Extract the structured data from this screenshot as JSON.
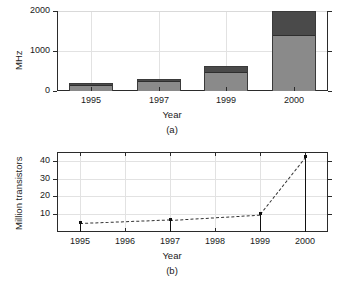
{
  "figure": {
    "panel_a_caption": "(a)",
    "panel_b_caption": "(b)"
  },
  "chart_data": [
    {
      "id": "panel-a",
      "type": "bar",
      "title": "",
      "subtitle": "(a)",
      "xlabel": "Year",
      "ylabel": "MHz",
      "categories": [
        "1995",
        "1997",
        "1999",
        "2000"
      ],
      "ylim": [
        0,
        2000
      ],
      "yticks": [
        0,
        1000,
        2000
      ],
      "yticklabels": [
        "0",
        "1000",
        "2000"
      ],
      "grid": true,
      "legend": "none",
      "stacked": true,
      "series": [
        {
          "name": "lower-segment",
          "color": "#8a8a8a",
          "values": [
            150,
            250,
            480,
            1400
          ]
        },
        {
          "name": "upper-segment",
          "color": "#4a4a4a",
          "values": [
            50,
            50,
            150,
            600
          ]
        }
      ],
      "totals": [
        200,
        300,
        630,
        2000
      ]
    },
    {
      "id": "panel-b",
      "type": "line",
      "title": "",
      "subtitle": "(b)",
      "xlabel": "Year",
      "ylabel": "Million transistors",
      "x": [
        1995,
        1997,
        1999,
        2000
      ],
      "xticks": [
        1995,
        1996,
        1997,
        1998,
        1999,
        2000
      ],
      "xticklabels": [
        "1995",
        "1996",
        "1997",
        "1998",
        "1999",
        "2000"
      ],
      "xlim": [
        1994.5,
        2000.5
      ],
      "ylim": [
        0,
        45
      ],
      "yticks": [
        10,
        20,
        30,
        40
      ],
      "yticklabels": [
        "10",
        "20",
        "30",
        "40"
      ],
      "grid": true,
      "legend": "none",
      "linestyle": "dashed",
      "marker": "square",
      "stems": true,
      "values": [
        5,
        7,
        10,
        42
      ]
    }
  ]
}
